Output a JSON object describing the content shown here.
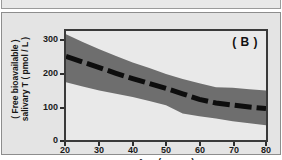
{
  "figure": {
    "panel_label": "( B )",
    "background_color": "#e4e4e4",
    "plot_background_color": "#e9e9e9",
    "band_color": "#6e6e6e",
    "line_color": "#0d0d0d"
  },
  "chart_data": {
    "type": "line",
    "title": "",
    "panel": "( B )",
    "xlabel": "Age ( years )",
    "ylabel_line1": "( Free bioavailable )",
    "ylabel_line2": "salivary T ( pmol / L )",
    "xlim": [
      20,
      80
    ],
    "ylim": [
      0,
      330
    ],
    "xticks": [
      20,
      30,
      40,
      50,
      60,
      70,
      80
    ],
    "xticklabels": [
      "20",
      "30",
      "40",
      "50",
      "60",
      "70",
      "80"
    ],
    "yticks": [
      0,
      100,
      200,
      300
    ],
    "yticklabels": [
      "0",
      "100",
      "200",
      "300"
    ],
    "grid": false,
    "legend": null,
    "x": [
      20,
      25,
      30,
      35,
      40,
      45,
      50,
      55,
      60,
      65,
      70,
      75,
      80
    ],
    "series": [
      {
        "name": "median (dashed)",
        "style": "dashed",
        "color": "#0d0d0d",
        "values": [
          253,
          236,
          219,
          202,
          186,
          171,
          156,
          140,
          123,
          112,
          106,
          100,
          95
        ]
      },
      {
        "name": "band upper",
        "style": "shaded-edge",
        "color": "#6e6e6e",
        "values": [
          320,
          297,
          275,
          254,
          235,
          218,
          200,
          185,
          172,
          160,
          158,
          154,
          150
        ]
      },
      {
        "name": "band lower",
        "style": "shaded-edge",
        "color": "#6e6e6e",
        "values": [
          175,
          162,
          150,
          140,
          130,
          118,
          105,
          80,
          72,
          65,
          57,
          51,
          45
        ]
      }
    ],
    "band": {
      "label": "shaded range",
      "fill_color": "#6e6e6e"
    }
  }
}
